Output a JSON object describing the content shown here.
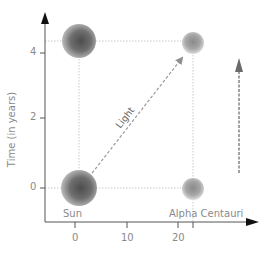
{
  "diagram": {
    "y_axis": {
      "label": "Time (in years)",
      "ticks": [
        {
          "value": "4",
          "y": 53
        },
        {
          "value": "2",
          "y": 118
        },
        {
          "value": "0",
          "y": 188
        }
      ]
    },
    "x_axis": {
      "ticks": [
        {
          "value": "0",
          "x": 75
        },
        {
          "value": "10",
          "x": 127
        },
        {
          "value": "20",
          "x": 178
        }
      ],
      "extra_tick_x": 193
    },
    "bodies": {
      "sun_label": "Sun",
      "alpha_label": "Alpha Centauri"
    },
    "arrows": {
      "light_label": "Light"
    },
    "colors": {
      "axis": "#555555",
      "arrowhead": "#111111",
      "grid": "#c8c8c8",
      "light_arrow": "#9a9a9a",
      "time_arrow": "#8a8a8a",
      "sun_dark": "#5a5a5a",
      "sun_light": "#bcbcbc",
      "alpha_dark": "#8c8c8c",
      "alpha_light": "#d6d6d6"
    }
  }
}
